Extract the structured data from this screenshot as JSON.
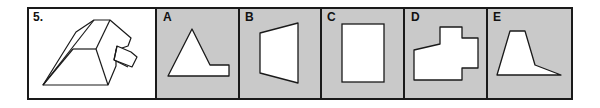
{
  "question": {
    "number_label": "5.",
    "options": [
      {
        "letter": "A"
      },
      {
        "letter": "B"
      },
      {
        "letter": "C"
      },
      {
        "letter": "D"
      },
      {
        "letter": "E"
      }
    ]
  },
  "colors": {
    "option_fill": "#c9c9c9",
    "border": "#1a1a1a",
    "shape_fill": "#ffffff"
  }
}
